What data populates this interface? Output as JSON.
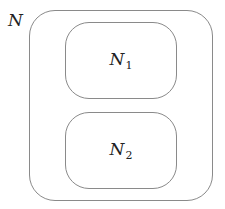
{
  "diagram": {
    "outer": {
      "label": "N"
    },
    "children": [
      {
        "label": "N",
        "subscript": "1"
      },
      {
        "label": "N",
        "subscript": "2"
      }
    ],
    "stroke_color": "#8a8a8a",
    "text_color": "#222222"
  }
}
